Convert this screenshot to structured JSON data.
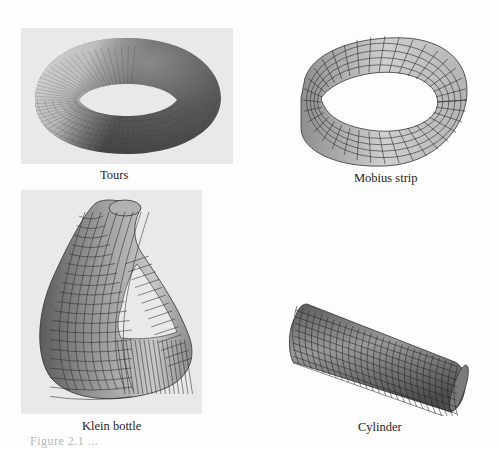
{
  "figures": [
    {
      "id": "torus",
      "label": "Tours"
    },
    {
      "id": "mobius",
      "label": "Mobius strip"
    },
    {
      "id": "klein",
      "label": "Klein bottle"
    },
    {
      "id": "cylinder",
      "label": "Cylinder"
    }
  ],
  "figure_caption": "Figure 2.1  ...",
  "colors": {
    "panel_bg": "#e9e9e9",
    "surface_light": "#d6d6d6",
    "surface_mid": "#9a9a9a",
    "surface_dark": "#4a4a4a",
    "grid_line": "#2a2a2a"
  }
}
